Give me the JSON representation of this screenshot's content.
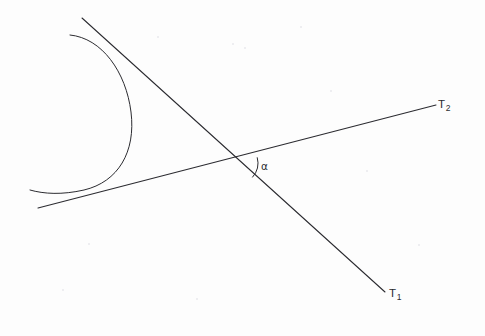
{
  "figure": {
    "kind": "geometry-diagram",
    "background_color": "#fdfdfd",
    "ink_color": "#2b2b30",
    "width": 485,
    "height": 336
  },
  "labels": {
    "tangent_line_1": {
      "base": "T",
      "subscript": "1"
    },
    "tangent_line_2": {
      "base": "T",
      "subscript": "2"
    },
    "angle": {
      "symbol": "α"
    }
  },
  "chart_data": {
    "type": "scatter",
    "xlabel": "",
    "ylabel": "",
    "xlim": [
      0,
      485
    ],
    "ylim": [
      336,
      0
    ],
    "grid": false,
    "legend": "none",
    "annotations": [
      {
        "text": "T₁",
        "x": 393,
        "y": 296,
        "name": "tangent-line-1-label"
      },
      {
        "text": "T₂",
        "x": 442,
        "y": 107,
        "name": "tangent-line-2-label"
      },
      {
        "text": "α",
        "x": 266,
        "y": 168,
        "name": "angle-alpha-label"
      }
    ],
    "series": [
      {
        "name": "tangent-line-1",
        "type": "line",
        "points": [
          [
            82,
            18
          ],
          [
            385,
            292
          ]
        ]
      },
      {
        "name": "tangent-line-2",
        "type": "line",
        "points": [
          [
            38,
            208
          ],
          [
            436,
            105
          ]
        ]
      },
      {
        "name": "circular-arc",
        "type": "arc",
        "center": [
          70,
          118
        ],
        "radius": 63,
        "start_angle_deg": -58,
        "end_angle_deg": 58,
        "points": [
          [
            70,
            35
          ],
          [
            115,
            60
          ],
          [
            133,
            118
          ],
          [
            108,
            176
          ],
          [
            30,
            190
          ]
        ]
      },
      {
        "name": "angle-marker-arc",
        "type": "arc",
        "center": [
          237,
          163
        ],
        "radius": 21,
        "start_angle_deg": -14.5,
        "end_angle_deg": 42.1,
        "points": [
          [
            257,
            158
          ],
          [
            252,
            177
          ]
        ]
      }
    ],
    "geometry": {
      "intersection_point": [
        237,
        163
      ],
      "tangency_point_line_1": [
        119,
        58
      ],
      "tangency_point_line_2": [
        96,
        188
      ],
      "angle_alpha_degrees": 57
    }
  },
  "specks": [
    {
      "x": 157,
      "y": 36,
      "d": 2
    },
    {
      "x": 232,
      "y": 43,
      "d": 2
    },
    {
      "x": 244,
      "y": 47,
      "d": 2
    },
    {
      "x": 88,
      "y": 243,
      "d": 2
    },
    {
      "x": 330,
      "y": 90,
      "d": 2
    },
    {
      "x": 418,
      "y": 244,
      "d": 2
    },
    {
      "x": 196,
      "y": 298,
      "d": 2
    },
    {
      "x": 62,
      "y": 289,
      "d": 2
    },
    {
      "x": 366,
      "y": 170,
      "d": 2
    },
    {
      "x": 300,
      "y": 26,
      "d": 2
    }
  ]
}
